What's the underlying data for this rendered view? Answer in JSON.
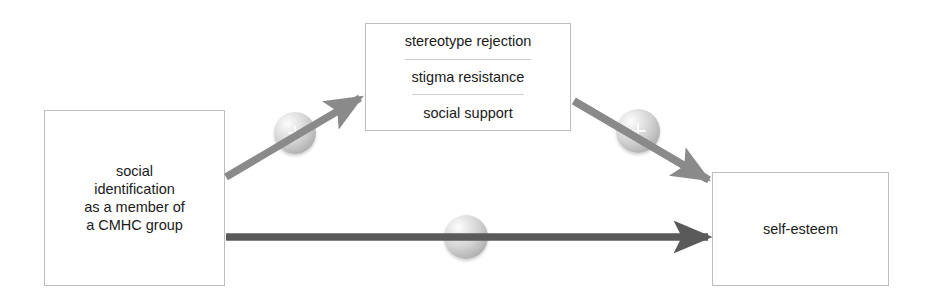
{
  "diagram": {
    "background_color": "#ffffff",
    "box_border_color": "#bdbdbd",
    "text_color": "#1a1a1a",
    "nodes": {
      "antecedent": {
        "lines": [
          "social",
          "identification",
          "as a member of",
          "a CMHC group"
        ]
      },
      "mediators": {
        "rows": [
          "stereotype rejection",
          "stigma resistance",
          "social support"
        ]
      },
      "outcome": {
        "label": "self-esteem"
      }
    },
    "edges": [
      {
        "id": "antecedent-to-mediators",
        "from": "antecedent",
        "to": "mediators",
        "sign": "+",
        "color": "#8a8a8a",
        "style": "solid"
      },
      {
        "id": "mediators-to-outcome",
        "from": "mediators",
        "to": "outcome",
        "sign": "+",
        "color": "#8a8a8a",
        "style": "solid"
      },
      {
        "id": "antecedent-to-outcome",
        "from": "antecedent",
        "to": "outcome",
        "sign": "−",
        "color": "#5a5a5a",
        "style": "solid"
      }
    ],
    "markers": {
      "plus_a": "+",
      "plus_b": "+",
      "minus": "−"
    }
  }
}
